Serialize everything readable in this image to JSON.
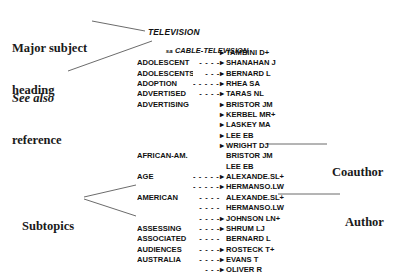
{
  "callouts": {
    "major_subject_heading": {
      "line1": "Major subject",
      "line2": "heading"
    },
    "see_also_reference": {
      "line1": "See also",
      "line2": "reference"
    },
    "subtopics": {
      "line1": "Subtopics",
      "line2": ""
    },
    "coauthor": {
      "line1": "Coauthor",
      "line2": ""
    },
    "author": {
      "line1": "Author",
      "line2": ""
    }
  },
  "record": {
    "heading": "TELEVISION",
    "see_also": {
      "tag": "sa",
      "term": "CABLE-TELEVISION"
    },
    "marker_glyph": "▸",
    "rows": [
      {
        "subject": "",
        "leader": "",
        "marker": "▸",
        "name": "TAMBINI D+"
      },
      {
        "subject": "ADOLESCENT",
        "leader": "- - - -",
        "marker": "▸",
        "name": "SHANAHAN J"
      },
      {
        "subject": "ADOLESCENTS",
        "leader": "- - -",
        "marker": "▸",
        "name": "BERNARD L"
      },
      {
        "subject": "ADOPTION",
        "leader": "- - - - - -",
        "marker": "▸",
        "name": "RHEA SA"
      },
      {
        "subject": "ADVERTISED",
        "leader": "- - - -",
        "marker": "▸",
        "name": "TARAS NL"
      },
      {
        "subject": "ADVERTISING",
        "leader": "",
        "marker": "▸",
        "name": "BRISTOR JM"
      },
      {
        "subject": "",
        "leader": "",
        "marker": "▸",
        "name": "KERBEL MR+"
      },
      {
        "subject": "",
        "leader": "",
        "marker": "▸",
        "name": "LASKEY MA"
      },
      {
        "subject": "",
        "leader": "",
        "marker": "▸",
        "name": "LEE EB"
      },
      {
        "subject": "",
        "leader": "",
        "marker": "▸",
        "name": "WRIGHT DJ"
      },
      {
        "subject": "AFRICAN-AM.",
        "leader": "",
        "marker": "",
        "name": "BRISTOR JM"
      },
      {
        "subject": "",
        "leader": "",
        "marker": "",
        "name": "LEE EB"
      },
      {
        "subject": "AGE",
        "leader": "- - - - - - - - - - -",
        "marker": "▸",
        "name": "ALEXANDE.SL+"
      },
      {
        "subject": "",
        "leader": "- - - - - - - - - - -",
        "marker": "▸",
        "name": "HERMANSO.LW"
      },
      {
        "subject": "AMERICAN",
        "leader": "- - - -",
        "marker": "",
        "name": "ALEXANDE.SL+"
      },
      {
        "subject": "",
        "leader": "- - - -",
        "marker": "",
        "name": "HERMANSO.LW"
      },
      {
        "subject": "",
        "leader": "- - - -",
        "marker": "▸",
        "name": "JOHNSON LN+"
      },
      {
        "subject": "ASSESSING",
        "leader": "- - - -",
        "marker": "▸",
        "name": "SHRUM LJ"
      },
      {
        "subject": "ASSOCIATED",
        "leader": "- - - -",
        "marker": "",
        "name": "BERNARD L"
      },
      {
        "subject": "AUDIENCES",
        "leader": "- - - -",
        "marker": "▸",
        "name": "ROSTECK T+"
      },
      {
        "subject": "AUSTRALIA",
        "leader": "- - - -",
        "marker": "▸",
        "name": "EVANS T"
      },
      {
        "subject": "",
        "leader": "- - -",
        "marker": "▸",
        "name": "OLIVER R"
      }
    ]
  },
  "colors": {
    "text": "#111111",
    "callout_text": "#1a1a1a",
    "leader_line": "#4b4b4b",
    "background": "#ffffff"
  }
}
